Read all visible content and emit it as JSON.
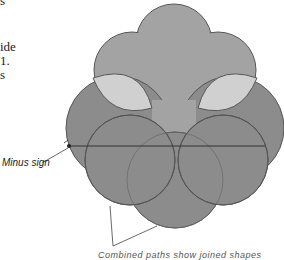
{
  "left_text_fragments": [
    "s",
    "ide",
    "1.",
    "s"
  ],
  "callouts": {
    "minus_sign": "Minus sign",
    "bottom_label": "Combined paths show joined shapes"
  },
  "colors": {
    "top_shape": "#a3a3a3",
    "highlight": "#d0d0d0",
    "lower_circles": "#8c8c8c",
    "outline": "#555555",
    "line": "#333333"
  }
}
